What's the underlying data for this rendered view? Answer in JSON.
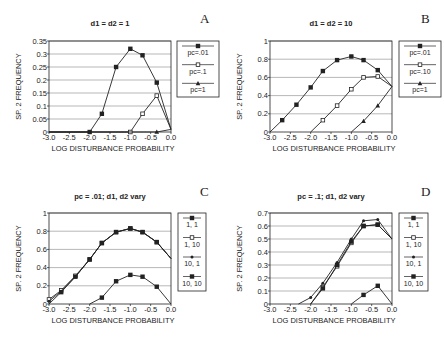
{
  "chart_data": [
    {
      "panel": "A",
      "type": "line",
      "title": "d1 = d2 = 1",
      "xlabel": "LOG DISTURBANCE PROBABILITY",
      "ylabel": "SP. 2 FREQUENCY",
      "xlim": [
        -3.0,
        0.0
      ],
      "ylim": [
        0,
        0.35
      ],
      "xticks": [
        "-3.0",
        "-2.5",
        "-2.0",
        "-1.5",
        "-1.0",
        "-0.5",
        "0.0"
      ],
      "yticks": [
        "0",
        "0.05",
        "0.1",
        "0.15",
        "0.2",
        "0.25",
        "0.3",
        "0.35"
      ],
      "ytick_values": [
        0,
        0.05,
        0.1,
        0.15,
        0.2,
        0.25,
        0.3,
        0.35
      ],
      "grid": "horizontal",
      "legend": "right",
      "series": [
        {
          "name": "pc=.01",
          "marker": "filled-square",
          "x": [
            -3.0,
            -2.0,
            -1.7,
            -1.35,
            -1.0,
            -0.7,
            -0.35,
            0.0
          ],
          "y": [
            0,
            0,
            0.07,
            0.25,
            0.32,
            0.295,
            0.19,
            0.01
          ]
        },
        {
          "name": "pc=.1",
          "marker": "open-square",
          "x": [
            -3.0,
            -1.0,
            -0.7,
            -0.35,
            0.0
          ],
          "y": [
            0,
            0,
            0.07,
            0.14,
            0.01
          ]
        },
        {
          "name": "pc=1",
          "marker": "triangle",
          "x": [
            -3.0,
            -0.35,
            0.0
          ],
          "y": [
            0,
            0,
            0.01
          ]
        }
      ]
    },
    {
      "panel": "B",
      "type": "line",
      "title": "d1 = d2 = 10",
      "xlabel": "LOG DISTURBANCE PROBABILITY",
      "ylabel": "SP. 2 FREQUENCY",
      "xlim": [
        -3.0,
        0.0
      ],
      "ylim": [
        0,
        1
      ],
      "xticks": [
        "-3.0",
        "-2.5",
        "-2.0",
        "-1.5",
        "-1.0",
        "-0.5",
        "0.0"
      ],
      "yticks": [
        "0",
        "0.2",
        "0.4",
        "0.6",
        "0.8",
        "1"
      ],
      "ytick_values": [
        0,
        0.2,
        0.4,
        0.6,
        0.8,
        1
      ],
      "grid": "horizontal",
      "legend": "right",
      "series": [
        {
          "name": "pc=.01",
          "marker": "filled-square",
          "x": [
            -3.0,
            -2.7,
            -2.35,
            -2.0,
            -1.7,
            -1.35,
            -1.0,
            -0.7,
            -0.35,
            0.0
          ],
          "y": [
            0,
            0.13,
            0.3,
            0.49,
            0.67,
            0.79,
            0.83,
            0.79,
            0.68,
            0.5
          ]
        },
        {
          "name": "pc=.10",
          "marker": "open-square",
          "x": [
            -2.0,
            -1.7,
            -1.35,
            -1.0,
            -0.7,
            -0.35,
            0.0
          ],
          "y": [
            0,
            0.13,
            0.29,
            0.47,
            0.6,
            0.61,
            0.5
          ]
        },
        {
          "name": "pc=1",
          "marker": "triangle",
          "x": [
            -1.0,
            -0.7,
            -0.35,
            0.0
          ],
          "y": [
            0,
            0.12,
            0.29,
            0.5
          ]
        }
      ]
    },
    {
      "panel": "C",
      "type": "line",
      "title": "pc = .01;  d1, d2 vary",
      "xlabel": "LOG DISTURBANCE PROBABILITY",
      "ylabel": "SP. 2 FREQUENCY",
      "xlim": [
        -3.0,
        0.0
      ],
      "ylim": [
        0,
        1
      ],
      "xticks": [
        "-3.0",
        "-2.5",
        "-2.0",
        "-1.5",
        "-1.0",
        "-0.5",
        "0.0"
      ],
      "yticks": [
        "0",
        "0.2",
        "0.4",
        "0.6",
        "0.8",
        "1"
      ],
      "ytick_values": [
        0,
        0.2,
        0.4,
        0.6,
        0.8,
        1
      ],
      "grid": "horizontal",
      "legend": "right",
      "series": [
        {
          "name": "1, 1",
          "marker": "filled-square",
          "x": [
            -2.0,
            -1.7,
            -1.35,
            -1.0,
            -0.7,
            -0.35,
            0.0
          ],
          "y": [
            0,
            0.07,
            0.25,
            0.32,
            0.3,
            0.19,
            0
          ]
        },
        {
          "name": "1, 10",
          "marker": "open-square",
          "x": [
            -3.0,
            -2.7,
            -2.35,
            -2.0,
            -1.7,
            -1.35,
            -1.0,
            -0.7,
            -0.35,
            0.0
          ],
          "y": [
            0.05,
            0.15,
            0.31,
            0.49,
            0.67,
            0.79,
            0.83,
            0.79,
            0.68,
            0.5
          ]
        },
        {
          "name": "10, 1",
          "marker": "dot",
          "x": [
            -3.0,
            -2.7,
            -2.35,
            -2.0,
            -1.7,
            -1.35,
            -1.0,
            -0.7,
            -0.35,
            0.0
          ],
          "y": [
            0.03,
            0.14,
            0.3,
            0.49,
            0.67,
            0.79,
            0.83,
            0.79,
            0.68,
            0.5
          ]
        },
        {
          "name": "10, 10",
          "marker": "filled-square",
          "x": [
            -3.0,
            -2.7,
            -2.35,
            -2.0,
            -1.7,
            -1.35,
            -1.0,
            -0.7,
            -0.35,
            0.0
          ],
          "y": [
            0,
            0.13,
            0.3,
            0.49,
            0.67,
            0.79,
            0.83,
            0.79,
            0.68,
            0.5
          ]
        }
      ]
    },
    {
      "panel": "D",
      "type": "line",
      "title": "pc = .1; d1, d2 vary",
      "xlabel": "LOG DISTURBANCE PROBABILITY",
      "ylabel": "SP. 2 FREQUENCY",
      "xlim": [
        -3.0,
        0.0
      ],
      "ylim": [
        0,
        0.7
      ],
      "xticks": [
        "-3.0",
        "-2.5",
        "-2.0",
        "-1.5",
        "-1.0",
        "-0.5",
        "0.0"
      ],
      "yticks": [
        "0",
        "0.1",
        "0.2",
        "0.3",
        "0.4",
        "0.5",
        "0.6",
        "0.7"
      ],
      "ytick_values": [
        0,
        0.1,
        0.2,
        0.3,
        0.4,
        0.5,
        0.6,
        0.7
      ],
      "grid": "horizontal",
      "legend": "right",
      "series": [
        {
          "name": "1, 1",
          "marker": "filled-square",
          "x": [
            -1.0,
            -0.7,
            -0.35,
            0.0
          ],
          "y": [
            0,
            0.07,
            0.14,
            0
          ]
        },
        {
          "name": "1, 10",
          "marker": "open-square",
          "x": [
            -2.0,
            -1.7,
            -1.35,
            -1.0,
            -0.7,
            -0.35,
            0.0
          ],
          "y": [
            0,
            0.13,
            0.29,
            0.47,
            0.6,
            0.61,
            0.5
          ]
        },
        {
          "name": "10, 1",
          "marker": "dot",
          "x": [
            -2.3,
            -2.0,
            -1.7,
            -1.35,
            -1.0,
            -0.7,
            -0.35,
            0.0
          ],
          "y": [
            0,
            0.05,
            0.16,
            0.32,
            0.5,
            0.64,
            0.65,
            0.5
          ]
        },
        {
          "name": "10, 10",
          "marker": "filled-square",
          "x": [
            -2.0,
            -1.7,
            -1.35,
            -1.0,
            -0.7,
            -0.35,
            0.0
          ],
          "y": [
            0,
            0.12,
            0.3,
            0.48,
            0.6,
            0.61,
            0.5
          ]
        }
      ]
    }
  ],
  "colors": {
    "line": "#222222",
    "grid": "#9a9a9a",
    "background": "#ffffff"
  }
}
